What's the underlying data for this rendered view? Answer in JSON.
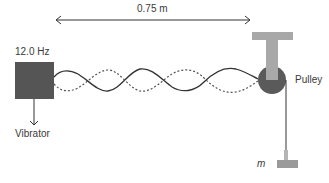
{
  "diagram": {
    "length_label": "0.75 m",
    "frequency_label": "12.0 Hz",
    "vibrator_label": "Vibrator",
    "pulley_label": "Pulley",
    "mass_label": "m",
    "loops": 4,
    "colors": {
      "vibrator": "#555555",
      "pulley": "#5a5a5a",
      "stand": "#a8a8a8",
      "mass": "#9a9a9a",
      "string": "#333333",
      "wave_dashed": "#555555",
      "arrow": "#333333"
    }
  }
}
